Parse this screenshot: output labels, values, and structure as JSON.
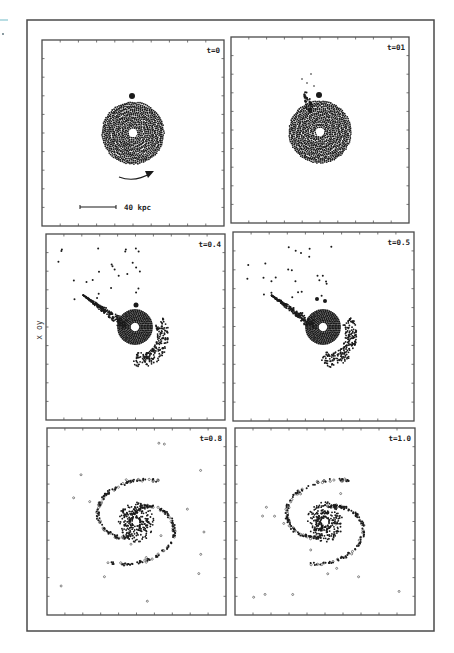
{
  "figure": {
    "axis_label": "x oy",
    "scale_bar_label": "40 kpc",
    "colors": {
      "ink": "#1a1a1a",
      "frame": "#4a4a4a",
      "background": "#ffffff"
    }
  },
  "panels": [
    {
      "label": "t=0",
      "box": [
        42,
        40,
        224,
        226
      ],
      "center": [
        133,
        133
      ],
      "phase": "initial"
    },
    {
      "label": "t=01",
      "box": [
        231,
        37,
        409,
        223
      ],
      "center": [
        320,
        132
      ],
      "phase": "early"
    },
    {
      "label": "t=0.4",
      "box": [
        46,
        234,
        225,
        420
      ],
      "center": [
        135,
        327
      ],
      "phase": "tail"
    },
    {
      "label": "t=0.5",
      "box": [
        233,
        232,
        414,
        421
      ],
      "center": [
        323,
        327
      ],
      "phase": "tail2"
    },
    {
      "label": "t=0.8",
      "box": [
        47,
        428,
        226,
        615
      ],
      "center": [
        136,
        522
      ],
      "phase": "spiral"
    },
    {
      "label": "t=1.0",
      "box": [
        235,
        428,
        415,
        615
      ],
      "center": [
        325,
        522
      ],
      "phase": "spiral2"
    }
  ],
  "chart_data": {
    "type": "scatter",
    "title": "",
    "xlabel": "",
    "ylabel": "x oy",
    "panels": [
      {
        "time": "t=0",
        "t": 0.0,
        "morphology": "axisymmetric disk, companion at top, rotation arrow clockwise-right"
      },
      {
        "time": "t=0.1",
        "t": 0.1,
        "morphology": "disk with small plume toward companion"
      },
      {
        "time": "t=0.4",
        "t": 0.4,
        "morphology": "long tidal tail to upper-left, counter-lobe lower-right"
      },
      {
        "time": "t=0.5",
        "t": 0.5,
        "morphology": "tail and bridge, developing arm"
      },
      {
        "time": "t=0.8",
        "t": 0.8,
        "morphology": "two-armed spiral"
      },
      {
        "time": "t=1.0",
        "t": 1.0,
        "morphology": "two-armed grand design spiral"
      }
    ],
    "annotations": [
      "40 kpc scale bar",
      "rotation direction arrow"
    ],
    "grid": false,
    "ticks_per_axis": 10,
    "layout": "3 rows x 2 columns"
  }
}
